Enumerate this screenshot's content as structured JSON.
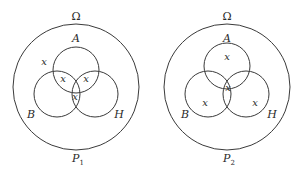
{
  "diagrams": [
    {
      "name": "P1",
      "universe_label": "Ω",
      "caption": "P",
      "caption_sub": "1",
      "sets": {
        "top": "A",
        "left": "B",
        "right": "H"
      },
      "marks": [
        {
          "region": "A only (left edge, outside B)",
          "label": "x"
        },
        {
          "region": "A ∩ B only",
          "label": "x"
        },
        {
          "region": "A ∩ H only",
          "label": "x"
        },
        {
          "region": "B ∩ H (incl. A∩B∩H lower)",
          "label": "x"
        }
      ]
    },
    {
      "name": "P2",
      "universe_label": "Ω",
      "caption": "P",
      "caption_sub": "2",
      "sets": {
        "top": "A",
        "left": "B",
        "right": "H"
      },
      "marks": [
        {
          "region": "A only",
          "label": "x"
        },
        {
          "region": "A ∩ B ∩ H",
          "label": "x"
        },
        {
          "region": "B only",
          "label": "x"
        },
        {
          "region": "H only",
          "label": "x"
        }
      ]
    }
  ]
}
